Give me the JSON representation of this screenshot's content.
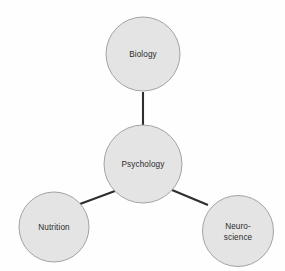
{
  "diagram": {
    "background_color": "#fefefe",
    "node_fill_color": "#e4e4e4",
    "node_stroke_color": "#9a9a9a",
    "edge_color": "#2e2e2e",
    "label_color": "#2b2b2b"
  },
  "nodes": [
    {
      "id": "psychology",
      "label": "Psychology",
      "lines": [
        "Psychology"
      ],
      "role": "center",
      "cx": 143,
      "cy": 164,
      "r": 39
    },
    {
      "id": "biology",
      "label": "Biology",
      "lines": [
        "Biology"
      ],
      "role": "branch",
      "cx": 143,
      "cy": 54,
      "r": 37
    },
    {
      "id": "nutrition",
      "label": "Nutrition",
      "lines": [
        "Nutrition"
      ],
      "role": "branch",
      "cx": 54,
      "cy": 227,
      "r": 35
    },
    {
      "id": "neuroscience",
      "label": "Neuro-science",
      "lines": [
        "Neuro-",
        "science"
      ],
      "role": "branch",
      "cx": 238,
      "cy": 231,
      "r": 35.5
    }
  ],
  "edges": [
    {
      "id": "psychology-biology",
      "from": "psychology",
      "to": "biology",
      "x1": 143,
      "y1": 126,
      "x2": 143,
      "y2": 92
    },
    {
      "id": "psychology-nutrition",
      "from": "psychology",
      "to": "nutrition",
      "x1": 115,
      "y1": 191,
      "x2": 80,
      "y2": 204
    },
    {
      "id": "psychology-neuroscience",
      "from": "psychology",
      "to": "neuroscience",
      "x1": 172,
      "y1": 190,
      "x2": 208,
      "y2": 205
    }
  ]
}
